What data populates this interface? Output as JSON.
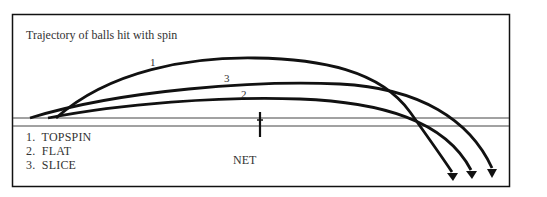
{
  "title": "Trajectory of balls hit with spin",
  "curve_labels": {
    "c1": "1",
    "c2": "2",
    "c3": "3"
  },
  "legend": [
    {
      "num": "1.",
      "label": "TOPSPIN"
    },
    {
      "num": "2.",
      "label": "FLAT"
    },
    {
      "num": "3.",
      "label": "SLICE"
    }
  ],
  "net_label": "NET",
  "colors": {
    "stroke": "#111111",
    "text": "#333333",
    "background": "#ffffff"
  }
}
